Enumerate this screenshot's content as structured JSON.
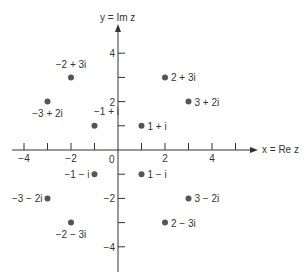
{
  "chart_data": {
    "type": "scatter",
    "title": "",
    "xlabel": "x = Re z",
    "ylabel": "y = Im z",
    "xlim": [
      -4.5,
      5
    ],
    "ylim": [
      -5,
      5
    ],
    "x_ticks": [
      -4,
      -3,
      -2,
      -1,
      1,
      2,
      3,
      4,
      5
    ],
    "x_tick_labels": {
      "-4": "−4",
      "-2": "−2",
      "0": "0",
      "2": "2",
      "4": "4"
    },
    "y_ticks": [
      4,
      3,
      2,
      1,
      -1,
      -2,
      -3,
      -4
    ],
    "y_tick_labels": {
      "4": "4",
      "2": "2",
      "-2": "−2",
      "-4": "−4"
    },
    "grid": false,
    "points": [
      {
        "x": 2,
        "y": 3,
        "label": "2 + 3i",
        "label_pos": "right"
      },
      {
        "x": 3,
        "y": 2,
        "label": "3 + 2i",
        "label_pos": "right"
      },
      {
        "x": 1,
        "y": 1,
        "label": "1 + i",
        "label_pos": "right"
      },
      {
        "x": -2,
        "y": 3,
        "label": "−2 + 3i",
        "label_pos": "above"
      },
      {
        "x": -3,
        "y": 2,
        "label": "−3 + 2i",
        "label_pos": "below"
      },
      {
        "x": -1,
        "y": 1,
        "label": "−1 + i",
        "label_pos": "above-right"
      },
      {
        "x": 1,
        "y": -1,
        "label": "1 − i",
        "label_pos": "right"
      },
      {
        "x": -1,
        "y": -1,
        "label": "−1 − i",
        "label_pos": "left"
      },
      {
        "x": 3,
        "y": -2,
        "label": "3 − 2i",
        "label_pos": "right"
      },
      {
        "x": -3,
        "y": -2,
        "label": "−3 − 2i",
        "label_pos": "left"
      },
      {
        "x": 2,
        "y": -3,
        "label": "2 − 3i",
        "label_pos": "right"
      },
      {
        "x": -2,
        "y": -3,
        "label": "−2 − 3i",
        "label_pos": "below"
      }
    ]
  },
  "axes": {
    "x_label": "x = Re z",
    "y_label": "y = Im z",
    "origin_label": "0"
  }
}
